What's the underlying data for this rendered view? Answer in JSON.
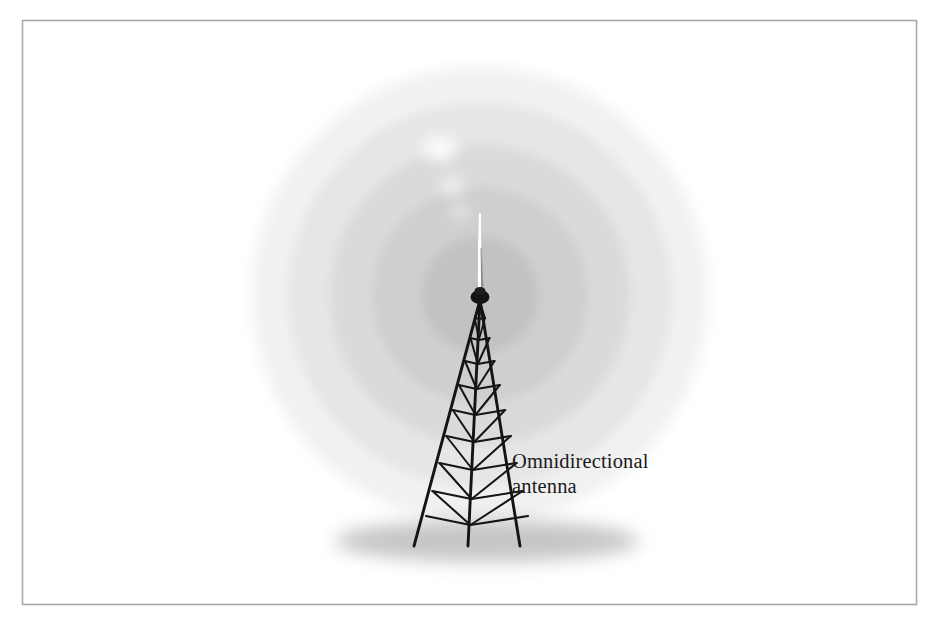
{
  "figure": {
    "kind": "technical-illustration",
    "background_color": "#ffffff",
    "canvas": {
      "width": 939,
      "height": 621
    }
  },
  "frame": {
    "name": "figure-border",
    "stroke_color": "#a8a8a8",
    "x": 22,
    "y": 20,
    "width": 894,
    "height": 584
  },
  "labels": {
    "callout": {
      "line1": "Omnidirectional",
      "line2": "antenna",
      "x": 512,
      "line1_baseline": 468,
      "line2_baseline": 493,
      "color": "#1a1a1a"
    }
  },
  "radiation_pattern": {
    "name": "concentric-radiation-rings",
    "center_x": 480,
    "center_y": 295,
    "rings": [
      {
        "label": "ring-5-outermost",
        "radius": 228,
        "color": "#f1f1f1"
      },
      {
        "label": "ring-4",
        "radius": 192,
        "color": "#e6e6e6"
      },
      {
        "label": "ring-3",
        "radius": 150,
        "color": "#dadada"
      },
      {
        "label": "ring-2",
        "radius": 108,
        "color": "#cfcfcf"
      },
      {
        "label": "ring-1-innermost",
        "radius": 58,
        "color": "#c2c2c2"
      }
    ],
    "highlights": [
      {
        "label": "specular-highlight-upper",
        "cx": 440,
        "cy": 148,
        "rx": 17,
        "ry": 13,
        "color": "#f7f7f7"
      },
      {
        "label": "specular-highlight-mid",
        "cx": 452,
        "cy": 186,
        "rx": 11,
        "ry": 9,
        "color": "#f0f0f0"
      },
      {
        "label": "specular-highlight-lower",
        "cx": 460,
        "cy": 212,
        "rx": 8,
        "ry": 6,
        "color": "#ececec"
      }
    ]
  },
  "antenna_mast": {
    "name": "omnidirectional-whip-mast",
    "tip_y": 213,
    "base_y": 296,
    "x": 480,
    "body_color": "#fbfbfb",
    "edge_color": "#9a9a9a",
    "cap": {
      "label": "mast-mounting-cap",
      "cx": 480,
      "cy": 297,
      "rx": 9,
      "ry": 7,
      "color": "#131313"
    }
  },
  "tower": {
    "name": "lattice-radio-tower",
    "color": "#141414",
    "apex_x": 480,
    "apex_y": 300,
    "base_y": 546,
    "legs": [
      {
        "label": "leg-left",
        "base_x": 414
      },
      {
        "label": "leg-center",
        "base_x": 468
      },
      {
        "label": "leg-right",
        "base_x": 520
      }
    ],
    "bracing_levels": 9,
    "has_diagonal_bracing": true
  },
  "ground_shadow": {
    "name": "ground-shadow-ellipse",
    "cx": 487,
    "cy": 541,
    "rx": 152,
    "ry": 21,
    "color": "#b6b6b6"
  }
}
